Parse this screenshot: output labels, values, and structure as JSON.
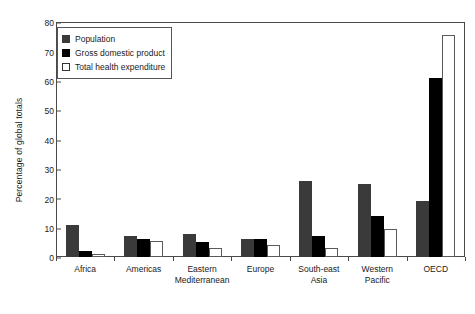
{
  "chart_data": {
    "type": "bar",
    "title": "",
    "xlabel": "",
    "ylabel": "Percentage of global totals",
    "ylim": [
      0,
      80
    ],
    "ytick_step": 10,
    "yticks": [
      0,
      10,
      20,
      30,
      40,
      50,
      60,
      70,
      80
    ],
    "grid": false,
    "legend_position": "top-left",
    "categories": [
      "Africa",
      "Americas",
      "Eastern\nMediterranean",
      "Europe",
      "South-east\nAsia",
      "Western\nPacific",
      "OECD"
    ],
    "series": [
      {
        "name": "Population",
        "color": "#3a3a3a",
        "values": [
          11,
          7,
          8,
          6,
          26,
          25,
          19
        ]
      },
      {
        "name": "Gross domestic product",
        "color": "#000000",
        "values": [
          2,
          6,
          5,
          6,
          7,
          14,
          61
        ]
      },
      {
        "name": "Total health expenditure",
        "color": "#ffffff",
        "values": [
          1,
          5.5,
          3,
          4,
          3,
          9.5,
          75.5
        ]
      }
    ]
  },
  "legend": {
    "items": [
      {
        "label": "Population",
        "swatch": "legend-swatch-population"
      },
      {
        "label": "Gross domestic product",
        "swatch": "legend-swatch-gdp"
      },
      {
        "label": "Total health expenditure",
        "swatch": "legend-swatch-health-expenditure"
      }
    ]
  }
}
